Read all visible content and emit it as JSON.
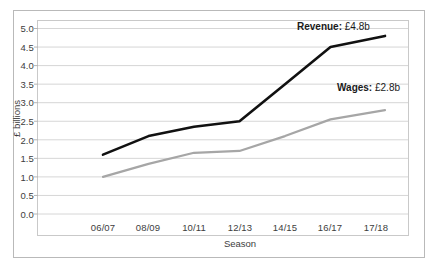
{
  "chart_data": {
    "type": "line",
    "title": "",
    "xlabel": "Season",
    "ylabel": "£ billions",
    "categories": [
      "06/07",
      "08/09",
      "10/11",
      "12/13",
      "14/15",
      "16/17",
      "17/18"
    ],
    "ylim": [
      0.0,
      5.0
    ],
    "yticks": [
      "0.0",
      "0.5",
      "1.0",
      "1.5",
      "2.0",
      "2.5",
      "3.0",
      "3.5",
      "4.0",
      "4.5",
      "5.0"
    ],
    "grid": "horizontal",
    "legend_position": "inline-annotation",
    "series": [
      {
        "name": "Revenue",
        "color": "#111111",
        "values": [
          1.6,
          2.1,
          2.35,
          2.5,
          3.5,
          4.5,
          4.8
        ],
        "end_label": "Revenue: £4.8b",
        "end_label_name": "Revenue:",
        "end_label_value": " £4.8b"
      },
      {
        "name": "Wages",
        "color": "#a6a6a6",
        "values": [
          1.0,
          1.35,
          1.65,
          1.7,
          2.1,
          2.55,
          2.8
        ],
        "end_label": "Wages: £2.8b",
        "end_label_name": "Wages:",
        "end_label_value": " £2.8b"
      }
    ]
  },
  "axes": {
    "y_title": "£ billions",
    "x_title": "Season"
  }
}
